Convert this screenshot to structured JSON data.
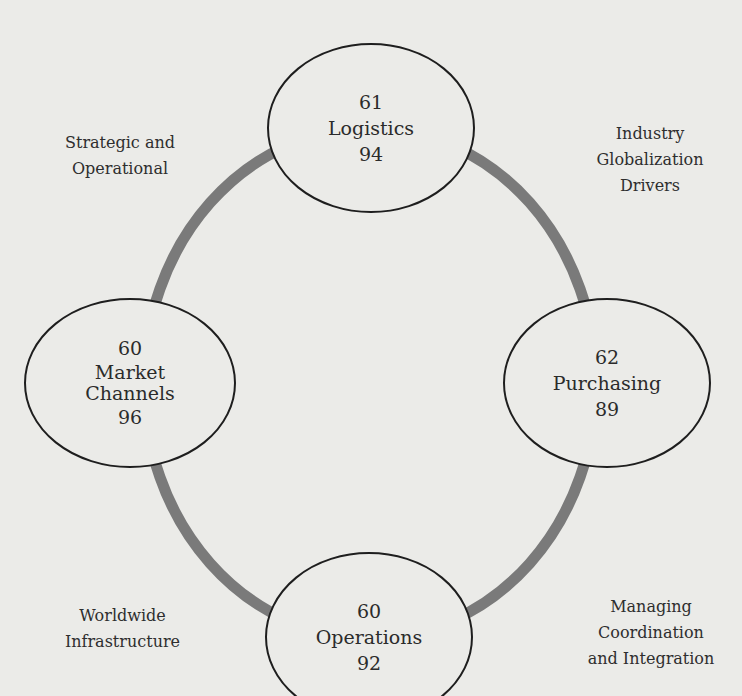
{
  "diagram": {
    "type": "cycle",
    "ring_color": "#7a7a7a",
    "ellipse_stroke": "#1e1e1e",
    "background": "#ebebe8",
    "nodes": [
      {
        "id": "logistics",
        "top_value": "61",
        "label_lines": [
          "Logistics"
        ],
        "bottom_value": "94"
      },
      {
        "id": "purchasing",
        "top_value": "62",
        "label_lines": [
          "Purchasing"
        ],
        "bottom_value": "89"
      },
      {
        "id": "operations",
        "top_value": "60",
        "label_lines": [
          "Operations"
        ],
        "bottom_value": "92"
      },
      {
        "id": "market-channels",
        "top_value": "60",
        "label_lines": [
          "Market",
          "Channels"
        ],
        "bottom_value": "96"
      }
    ],
    "corner_labels": {
      "top_left": [
        "Strategic and",
        "Operational"
      ],
      "top_right": [
        "Industry",
        "Globalization",
        "Drivers"
      ],
      "bottom_left": [
        "Worldwide",
        "Infrastructure"
      ],
      "bottom_right": [
        "Managing",
        "Coordination",
        "and Integration"
      ]
    }
  }
}
